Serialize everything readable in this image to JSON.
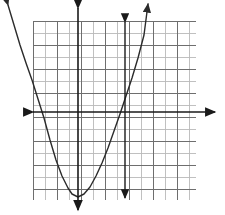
{
  "figure": {
    "title": "",
    "background_color": "#ffffff",
    "grid": {
      "x_left_px": 33,
      "y_top_px": 21,
      "x_right_px": 196,
      "y_bottom_px": 200,
      "cell_px": 12,
      "columns": 14,
      "rows": 15,
      "minor_color": "#b9b9b9",
      "major_color": "#6e6e6e",
      "major_every": 2,
      "visible": true
    },
    "axes": {
      "x_axis": {
        "label": "x-axis",
        "pixel_y": 112,
        "from_px": 33,
        "to_px": 215,
        "color": "#1a1a1a",
        "width_px": 1.6,
        "arrow_start": true,
        "arrow_end": true
      },
      "y_axis": {
        "label": "y-axis",
        "pixel_x": 78,
        "from_px": 8,
        "to_px": 210,
        "color": "#1a1a1a",
        "width_px": 1.6,
        "arrow_start": true,
        "arrow_end": true
      }
    },
    "vertical_line": {
      "label": "vertical-line",
      "pixel_x": 125,
      "from_px": 22,
      "to_px": 198,
      "color": "#1a1a1a",
      "width_px": 1.4,
      "arrow_start": true,
      "arrow_end": true
    }
  },
  "chart_data": {
    "type": "line",
    "title": "",
    "xlabel": "",
    "ylabel": "",
    "grid": true,
    "legend": "none",
    "xlim": [
      -3.75,
      10.25
    ],
    "ylim": [
      -7.33,
      7.58
    ],
    "curves": [
      {
        "name": "parabola",
        "equation": "y = a*(x)^2 + k",
        "vertex": [
          0,
          -7.08
        ],
        "opens": "up",
        "a": 1.0,
        "color": "#2b2b2b",
        "width_px": 1.4,
        "arrow_start": true,
        "arrow_end": true,
        "pixel_points": [
          [
            8,
            5
          ],
          [
            14,
            25
          ],
          [
            20,
            45
          ],
          [
            26,
            63
          ],
          [
            32,
            80
          ],
          [
            38,
            99
          ],
          [
            44,
            118
          ],
          [
            50,
            140
          ],
          [
            56,
            160
          ],
          [
            62,
            176
          ],
          [
            68,
            188
          ],
          [
            72,
            194
          ],
          [
            78,
            197
          ],
          [
            84,
            194
          ],
          [
            90,
            187
          ],
          [
            96,
            176
          ],
          [
            102,
            163
          ],
          [
            108,
            148
          ],
          [
            114,
            131
          ],
          [
            120,
            114
          ],
          [
            126,
            96
          ],
          [
            132,
            78
          ],
          [
            138,
            58
          ],
          [
            144,
            35
          ],
          [
            148,
            4
          ]
        ]
      }
    ]
  },
  "annotations": {
    "arrow_head_length_px": 7,
    "arrow_head_width_px": 6,
    "stroke_color": "#1a1a1a"
  }
}
